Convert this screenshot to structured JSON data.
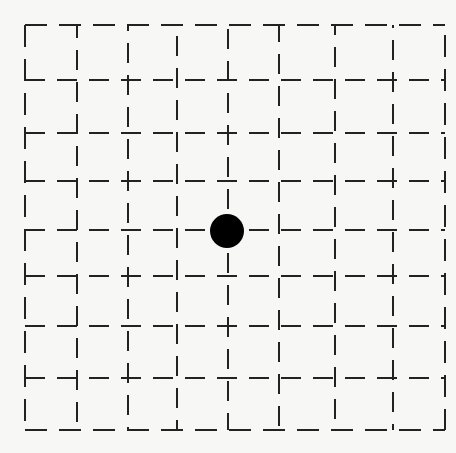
{
  "figure": {
    "type": "dashed-grid-with-point",
    "background_color": "#f7f7f5",
    "line_color": "#222222",
    "grid": {
      "left": 25,
      "top": 25,
      "right": 445,
      "bottom": 430,
      "vertical_lines_x": [
        25,
        77,
        128,
        177,
        228,
        279,
        335,
        393,
        445
      ],
      "horizontal_lines_y": [
        25,
        80,
        133,
        181,
        230,
        276,
        326,
        378,
        430
      ],
      "columns": 8,
      "rows": 8
    },
    "point": {
      "cx": 227,
      "cy": 231,
      "r": 17,
      "color": "#000000",
      "grid_column_index": 4,
      "grid_row_index": 4
    }
  }
}
